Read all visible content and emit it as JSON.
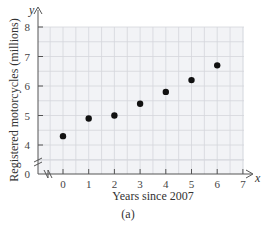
{
  "chart_data": {
    "type": "scatter",
    "title": "",
    "xlabel": "Years since 2007",
    "ylabel": "Registered motorcycles (millions)",
    "x_axis_var": "x",
    "y_axis_var": "y",
    "caption": "(a)",
    "x": [
      0,
      1,
      2,
      3,
      4,
      5,
      6
    ],
    "y": [
      4.3,
      4.9,
      5.0,
      5.4,
      5.8,
      6.2,
      6.7
    ],
    "x_ticks": [
      "0",
      "1",
      "2",
      "3",
      "4",
      "5",
      "6",
      "7"
    ],
    "y_ticks": [
      "0",
      "4",
      "5",
      "6",
      "7",
      "8"
    ],
    "xlim": [
      -0.5,
      7
    ],
    "ylim": [
      0,
      8
    ],
    "y_axis_break": true,
    "x_axis_break": true,
    "grid": true
  }
}
